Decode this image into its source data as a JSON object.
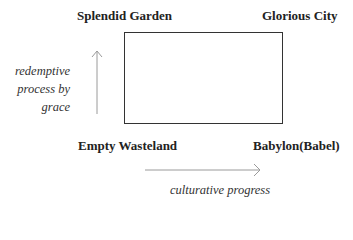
{
  "diagram": {
    "corners": {
      "top_left": "Splendid Garden",
      "top_right": "Glorious City",
      "bottom_left": "Empty Wasteland",
      "bottom_right": "Babylon(Babel)"
    },
    "vertical_axis": {
      "label_lines": [
        "redemptive",
        "process by",
        "grace"
      ],
      "direction": "up"
    },
    "horizontal_axis": {
      "label": "culturative progress",
      "direction": "right"
    },
    "colors": {
      "box_stroke": "#333333",
      "arrow_stroke": "#999999",
      "text": "#222222"
    }
  }
}
